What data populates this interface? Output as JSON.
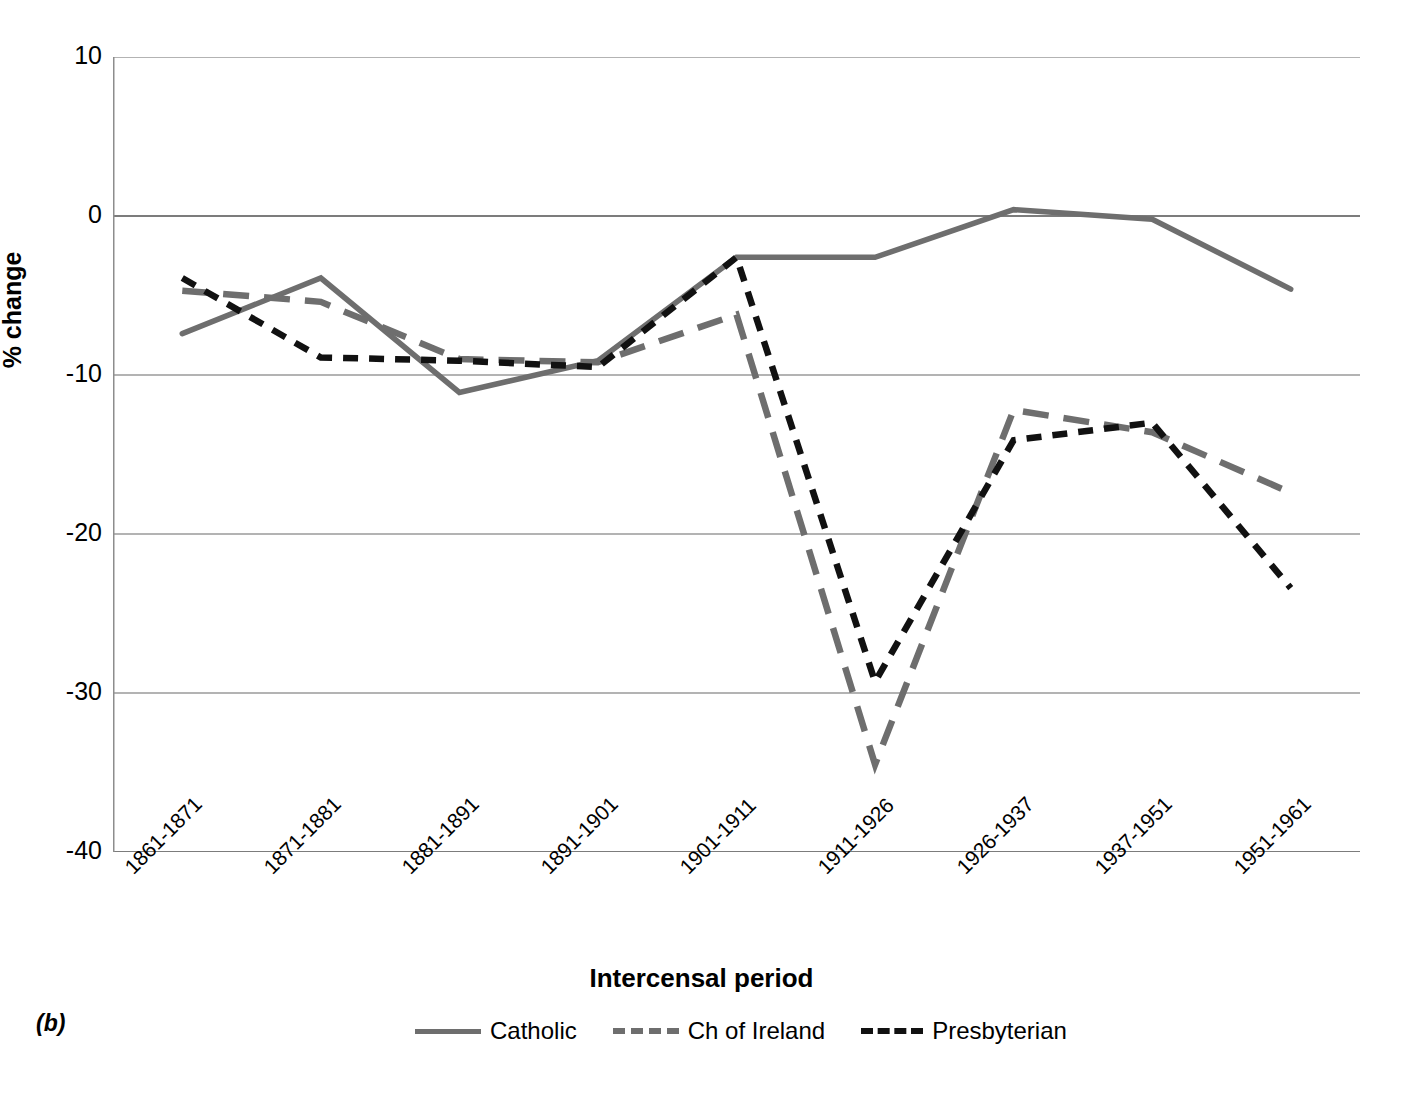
{
  "panel": {
    "label": "(b)"
  },
  "chart_data": {
    "type": "line",
    "title": "",
    "xlabel": "Intercensal period",
    "ylabel": "% change",
    "categories": [
      "1861-1871",
      "1871-1881",
      "1881-1891",
      "1891-1901",
      "1901-1911",
      "1911-1926",
      "1926-1937",
      "1937-1951",
      "1951-1961"
    ],
    "ylim": [
      -40,
      10
    ],
    "yticks": [
      10,
      0,
      -10,
      -20,
      -30,
      -40
    ],
    "ytick_labels": [
      "10",
      "0",
      "-10",
      "-20",
      "-30",
      "-40"
    ],
    "grid": "horizontal",
    "legend_position": "bottom",
    "series": [
      {
        "name": "Catholic",
        "color": "#6e6e6e",
        "style": "solid",
        "values": [
          -7.4,
          -3.9,
          -11.1,
          -9.1,
          -2.6,
          -2.6,
          0.4,
          -0.2,
          -4.6
        ]
      },
      {
        "name": "Ch of Ireland",
        "color": "#6e6e6e",
        "style": "dashed",
        "values": [
          -4.7,
          -5.4,
          -9.0,
          -9.2,
          -6.2,
          -34.5,
          -12.2,
          -13.6,
          -17.4
        ]
      },
      {
        "name": "Presbyterian",
        "color": "#111111",
        "style": "dotted",
        "values": [
          -3.9,
          -8.9,
          -9.1,
          -9.5,
          -2.6,
          -29.3,
          -14.1,
          -13.0,
          -23.4
        ]
      }
    ]
  }
}
